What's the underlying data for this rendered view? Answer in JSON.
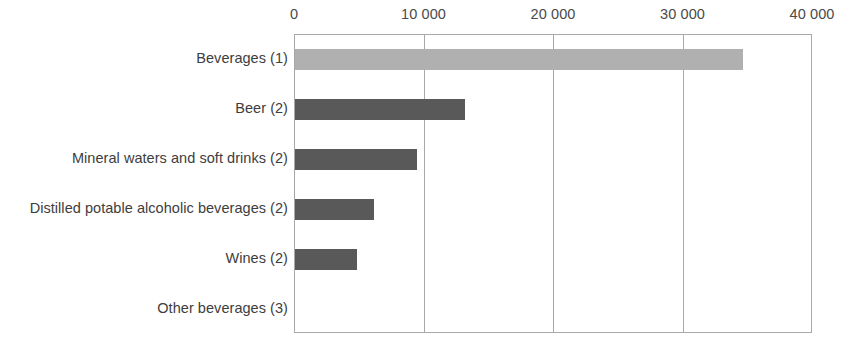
{
  "chart_data": {
    "type": "bar",
    "orientation": "horizontal",
    "title": "",
    "subtitle": "",
    "xlabel": "",
    "ylabel": "",
    "xlim": [
      0,
      40000
    ],
    "grid": true,
    "legend": false,
    "legend_position": "none",
    "axis_ticks": [
      "0",
      "10 000",
      "20 000",
      "30 000",
      "40 000"
    ],
    "axis_tick_values": [
      0,
      10000,
      20000,
      30000,
      40000
    ],
    "categories": [
      "Beverages (1)",
      "Beer (2)",
      "Mineral waters and soft drinks (2)",
      "Distilled potable alcoholic beverages (2)",
      "Wines (2)",
      "Other beverages (3)"
    ],
    "values": [
      34600,
      13100,
      9400,
      6100,
      4800,
      0
    ],
    "bar_colors": [
      "#b0b0b0",
      "#595959",
      "#595959",
      "#595959",
      "#595959",
      "#595959"
    ],
    "series": [
      {
        "name": "",
        "values": [
          34600,
          13100,
          9400,
          6100,
          4800,
          0
        ]
      }
    ],
    "annotations": []
  },
  "style": {
    "frame_color": "#a8a8a8",
    "grid_color": "#a8a8a8",
    "background": "#ffffff",
    "label_color": "#3d3d3d",
    "tick_color": "#4a4a4a",
    "highlight_bar_color": "#b0b0b0",
    "bar_color": "#595959"
  }
}
